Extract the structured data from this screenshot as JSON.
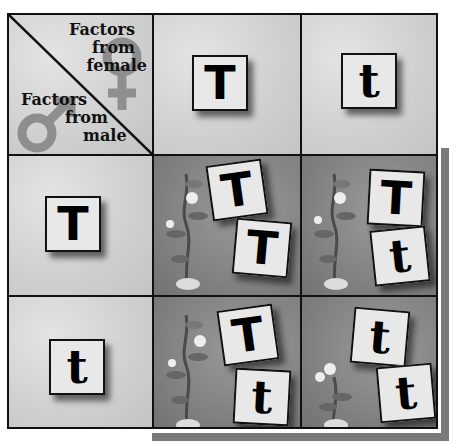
{
  "corner": {
    "female_label_lines": [
      "Factors",
      "from",
      "female"
    ],
    "male_label_lines": [
      "Factors",
      "from",
      "male"
    ],
    "female_symbol": "female-symbol",
    "male_symbol": "male-symbol"
  },
  "column_headers": [
    "T",
    "t"
  ],
  "row_headers": [
    "T",
    "t"
  ],
  "offspring": [
    [
      "T",
      "T"
    ],
    [
      "T",
      "t"
    ],
    [
      "T",
      "t"
    ],
    [
      "t",
      "t"
    ]
  ],
  "plants": [
    "tall",
    "tall",
    "tall",
    "short"
  ],
  "colors": {
    "grid_line": "#111111",
    "header_bg": "#cfcfcf",
    "offspring_bg": "#828282",
    "tile_bg": "#e8e8e8",
    "shadow": "#7a7a7a"
  }
}
